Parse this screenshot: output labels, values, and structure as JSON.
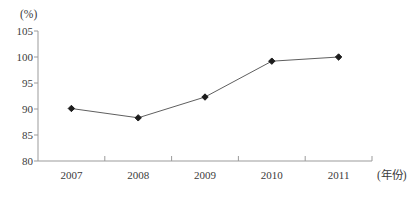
{
  "chart_data": {
    "type": "line",
    "categories": [
      "2007",
      "2008",
      "2009",
      "2010",
      "2011"
    ],
    "values": [
      90.1,
      88.3,
      92.3,
      99.2,
      100.0
    ],
    "title": "",
    "xlabel": "(年份)",
    "ylabel": "(%)",
    "ylim": [
      80,
      105
    ],
    "ytick_step": 5,
    "ytick_labels": [
      "80",
      "85",
      "90",
      "95",
      "100",
      "105"
    ],
    "grid": false,
    "legend": false,
    "marker": "diamond",
    "colors": {
      "line": "#5f5f5f",
      "marker": "#1c1c1c",
      "axis": "#9b9b9b",
      "text": "#3b3b3b"
    }
  }
}
